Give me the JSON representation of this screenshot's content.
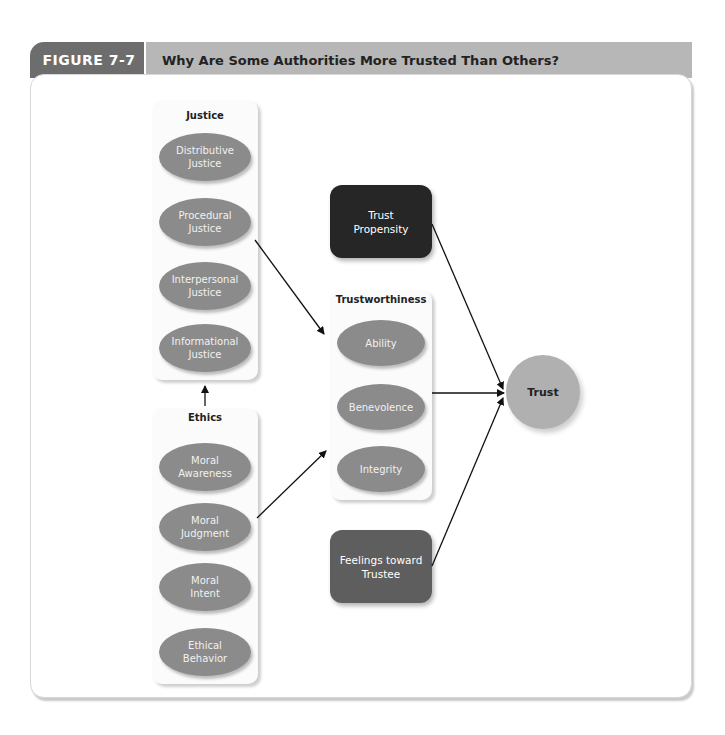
{
  "header": {
    "figure_label": "FIGURE 7-7",
    "title": "Why Are Some Authorities More Trusted Than Others?"
  },
  "colors": {
    "tab_dark": "#6d6d6d",
    "title_bar": "#b7b7b7",
    "ellipse_fill": "#8b8b8b",
    "trust_propensity_fill": "#262626",
    "feelings_fill": "#5e5e5e",
    "trust_fill": "#b0b0b0"
  },
  "justice": {
    "title": "Justice",
    "items": [
      "Distributive\nJustice",
      "Procedural\nJustice",
      "Interpersonal\nJustice",
      "Informational\nJustice"
    ]
  },
  "ethics": {
    "title": "Ethics",
    "items": [
      "Moral\nAwareness",
      "Moral\nJudgment",
      "Moral\nIntent",
      "Ethical\nBehavior"
    ]
  },
  "trust_propensity": {
    "label": "Trust\nPropensity"
  },
  "trustworthiness": {
    "title": "Trustworthiness",
    "items": [
      "Ability",
      "Benevolence",
      "Integrity"
    ]
  },
  "feelings": {
    "label": "Feelings toward\nTrustee"
  },
  "trust": {
    "label": "Trust"
  },
  "edges": [
    {
      "from": "Ethics",
      "to": "Justice"
    },
    {
      "from": "Justice",
      "to": "Trustworthiness"
    },
    {
      "from": "Ethics",
      "to": "Trustworthiness"
    },
    {
      "from": "Trust Propensity",
      "to": "Trust"
    },
    {
      "from": "Trustworthiness",
      "to": "Trust"
    },
    {
      "from": "Feelings toward Trustee",
      "to": "Trust"
    }
  ]
}
